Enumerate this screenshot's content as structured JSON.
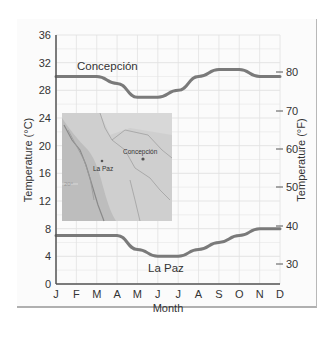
{
  "chart_data": {
    "type": "line",
    "title": "",
    "xlabel": "Month",
    "ylabel": "Temperature (°C)",
    "ylabel_right": "Temperature (°F)",
    "categories": [
      "J",
      "F",
      "M",
      "A",
      "M",
      "J",
      "J",
      "A",
      "S",
      "O",
      "N",
      "D"
    ],
    "ylim": [
      0,
      36
    ],
    "yticks": [
      0,
      4,
      8,
      12,
      16,
      20,
      24,
      28,
      32,
      36
    ],
    "yticks_right": [
      30,
      40,
      50,
      60,
      70,
      80
    ],
    "grid": true,
    "legend": "inline labels",
    "series": [
      {
        "name": "Concepción",
        "values": [
          30,
          30,
          30,
          29,
          27,
          27,
          28,
          30,
          31,
          31,
          30,
          30
        ]
      },
      {
        "name": "La Paz",
        "values": [
          7,
          7,
          7,
          7,
          5,
          4,
          4,
          5,
          6,
          7,
          8,
          8
        ]
      }
    ],
    "inset": {
      "type": "map",
      "labels": [
        "Concepción",
        "La Paz",
        "20°"
      ]
    }
  },
  "labels": {
    "x_axis_title": "Month",
    "y_axis_left_title": "Temperature (°C)",
    "y_axis_right_title": "Temperature (°F)",
    "series_concepcion": "Concepción",
    "series_lapaz": "La Paz",
    "map_concepcion": "Concepción",
    "map_lapaz": "La Paz",
    "map_lat": "20°"
  },
  "colors": {
    "line": "#7a7a7a",
    "grid": "#e2e2e2",
    "axis": "#555555",
    "map_bg": "#c9c9c9"
  }
}
